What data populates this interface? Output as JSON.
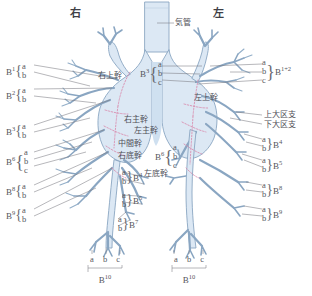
{
  "diagram": {
    "title_right": "右",
    "title_left": "左",
    "trachea_label": "気管",
    "colors": {
      "airway_fill": "#dce8f4",
      "airway_stroke": "#8ba8c4",
      "segment_dotted": "#d98fb0",
      "label_text": "#55555c",
      "leader_line": "#7a7a82",
      "background": "#ffffff"
    }
  },
  "trunk_labels": {
    "right_upper": "右上幹",
    "left_upper": "左上幹",
    "right_main": "右主幹",
    "left_main": "左主幹",
    "intermediate": "中間幹",
    "right_basal": "右底幹",
    "left_basal": "左底幹",
    "upper_division": "上大区支",
    "lower_division": "下大区支"
  },
  "right_lung_outer": [
    {
      "name": "B",
      "sup": "1",
      "subs": [
        "a",
        "b"
      ]
    },
    {
      "name": "B",
      "sup": "2",
      "subs": [
        "a",
        "b"
      ]
    },
    {
      "name": "B",
      "sup": "3",
      "subs": [
        "a",
        "b"
      ]
    },
    {
      "name": "B",
      "sup": "6",
      "subs": [
        "a",
        "b",
        "c"
      ]
    },
    {
      "name": "B",
      "sup": "8",
      "subs": [
        "a",
        "b"
      ]
    },
    {
      "name": "B",
      "sup": "9",
      "subs": [
        "a",
        "b"
      ]
    }
  ],
  "right_lung_inner": [
    {
      "name": "B",
      "sup": "4",
      "subs": [
        "a",
        "b"
      ]
    },
    {
      "name": "B",
      "sup": "5",
      "subs": [
        "a",
        "b"
      ]
    },
    {
      "name": "B",
      "sup": "7",
      "subs": [
        "a",
        "b"
      ]
    }
  ],
  "left_lung_inner": [
    {
      "name": "B",
      "sup": "3",
      "subs": [
        "a",
        "b",
        "c"
      ]
    },
    {
      "name": "B",
      "sup": "6",
      "subs": [
        "a",
        "b",
        "c"
      ]
    }
  ],
  "left_lung_outer": [
    {
      "name": "B",
      "sup": "1+2",
      "subs": [
        "a",
        "b",
        "c"
      ]
    },
    {
      "name": "B",
      "sup": "4",
      "subs": [
        "a",
        "b"
      ]
    },
    {
      "name": "B",
      "sup": "5",
      "subs": [
        "a",
        "b"
      ]
    },
    {
      "name": "B",
      "sup": "8",
      "subs": [
        "a",
        "b"
      ]
    },
    {
      "name": "B",
      "sup": "9",
      "subs": [
        "a",
        "b"
      ]
    }
  ],
  "bottom_right_lung": {
    "subs": [
      "a",
      "b",
      "c"
    ],
    "name": "B",
    "sup": "10"
  },
  "bottom_left_lung": {
    "subs": [
      "a",
      "b",
      "c"
    ],
    "name": "B",
    "sup": "10"
  }
}
